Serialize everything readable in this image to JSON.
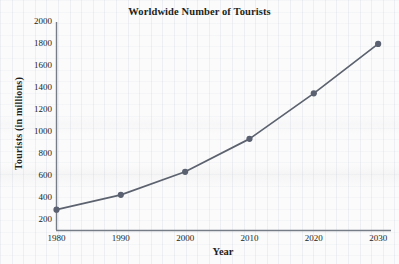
{
  "chart_data": {
    "type": "line",
    "title": "Worldwide Number of Tourists",
    "xlabel": "Year",
    "ylabel": "Tourists (in millions)",
    "x": [
      1980,
      1990,
      2000,
      2010,
      2020,
      2030
    ],
    "values": [
      290,
      425,
      635,
      935,
      1350,
      1800
    ],
    "categories": [
      "1980",
      "1990",
      "2000",
      "2010",
      "2020",
      "2030"
    ],
    "xlim": [
      1980,
      2032
    ],
    "ylim": [
      100,
      2000
    ],
    "xticks": [
      "1980",
      "1990",
      "2000",
      "2010",
      "2020",
      "2030"
    ],
    "yticks": [
      "200",
      "400",
      "600",
      "800",
      "1000",
      "1200",
      "1400",
      "1600",
      "1800",
      "2000"
    ],
    "grid": "faint graph-paper grid",
    "legend": "none",
    "series": [
      {
        "name": "Worldwide tourists",
        "values": [
          290,
          425,
          635,
          935,
          1350,
          1800
        ],
        "line_color": "#595f6b",
        "marker_color": "#5b6170",
        "marker": "circle"
      }
    ],
    "points": [
      {
        "x": "1980",
        "y": 290
      },
      {
        "x": "1990",
        "y": 425
      },
      {
        "x": "2000",
        "y": 635
      },
      {
        "x": "2010",
        "y": 935
      },
      {
        "x": "2020",
        "y": 1350
      },
      {
        "x": "2030",
        "y": 1800
      }
    ],
    "axis_color": "#6f757f",
    "text_color": "#231f20",
    "background_color": "#fbfbfc"
  }
}
